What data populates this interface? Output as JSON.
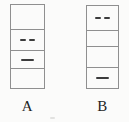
{
  "figure": {
    "background_color": "#fbfbfa",
    "border_color": "#8f8f8f",
    "dash_color": "#3c3c3c",
    "label_color": "#1f1f1f",
    "diagrams": [
      {
        "label": "A",
        "cells": [
          {
            "content": "empty"
          },
          {
            "content": "double-dash"
          },
          {
            "content": "single-dash"
          },
          {
            "content": "empty"
          }
        ]
      },
      {
        "label": "B",
        "cells": [
          {
            "content": "double-dash"
          },
          {
            "content": "empty"
          },
          {
            "content": "empty"
          },
          {
            "content": "single-dash"
          }
        ]
      }
    ]
  }
}
